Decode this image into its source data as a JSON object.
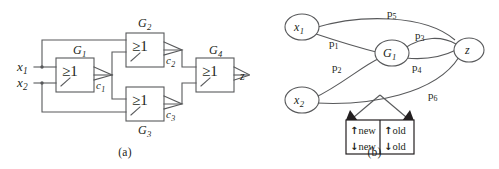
{
  "figure": {
    "panel_a": {
      "caption": "(a)",
      "type": "logic-circuit",
      "inputs": [
        {
          "id": "x1",
          "label": "x",
          "sub": "1"
        },
        {
          "id": "x2",
          "label": "x",
          "sub": "2"
        }
      ],
      "output": {
        "id": "z",
        "label": "z"
      },
      "gates": [
        {
          "id": "G1",
          "name": "G",
          "sub": "1",
          "symbol": "≥1",
          "label_pos": "top-right"
        },
        {
          "id": "G2",
          "name": "G",
          "sub": "2",
          "symbol": "≥1",
          "label_pos": "top"
        },
        {
          "id": "G3",
          "name": "G",
          "sub": "3",
          "symbol": "≥1",
          "label_pos": "bottom"
        },
        {
          "id": "G4",
          "name": "G",
          "sub": "4",
          "symbol": "≥1",
          "label_pos": "top"
        }
      ],
      "signals": [
        {
          "id": "c1",
          "name": "c",
          "sub": "1",
          "from": "G1"
        },
        {
          "id": "c2",
          "name": "c",
          "sub": "2",
          "from": "G2"
        },
        {
          "id": "c3",
          "name": "c",
          "sub": "3",
          "from": "G3"
        }
      ]
    },
    "panel_b": {
      "caption": "(b)",
      "type": "path-graph",
      "nodes": [
        {
          "id": "x1",
          "label": "x",
          "sub": "1"
        },
        {
          "id": "x2",
          "label": "x",
          "sub": "2"
        },
        {
          "id": "G1",
          "label": "G",
          "sub": "1"
        },
        {
          "id": "z",
          "label": "z",
          "sub": ""
        }
      ],
      "edges": [
        {
          "id": "p1",
          "name": "p",
          "sub": "1",
          "from": "x1",
          "to": "G1"
        },
        {
          "id": "p2",
          "name": "p",
          "sub": "2",
          "from": "x2",
          "to": "G1"
        },
        {
          "id": "p3",
          "name": "p",
          "sub": "3",
          "from": "G1",
          "to": "z"
        },
        {
          "id": "p4",
          "name": "p",
          "sub": "4",
          "from": "G1",
          "to": "z"
        },
        {
          "id": "p5",
          "name": "p",
          "sub": "5",
          "from": "x1",
          "to": "z"
        },
        {
          "id": "p6",
          "name": "p",
          "sub": "6",
          "from": "x2",
          "to": "z"
        }
      ],
      "legend": {
        "rows": [
          [
            {
              "arrow": "↑",
              "text": "new"
            },
            {
              "arrow": "↑",
              "text": "old"
            }
          ],
          [
            {
              "arrow": "↓",
              "text": "new"
            },
            {
              "arrow": "↓",
              "text": "old"
            }
          ]
        ]
      }
    },
    "colors": {
      "line": "#58595b",
      "text": "#231f20",
      "background": "#ffffff"
    }
  }
}
